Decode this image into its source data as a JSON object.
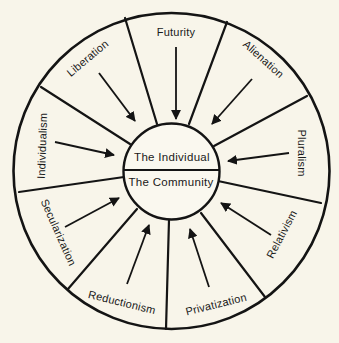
{
  "center": {
    "top_label": "The Individual",
    "bottom_label": "The Community"
  },
  "forces": [
    {
      "id": "futurity",
      "label": "Futurity"
    },
    {
      "id": "alienation",
      "label": "Alienation"
    },
    {
      "id": "pluralism",
      "label": "Pluralism"
    },
    {
      "id": "relativism",
      "label": "Relativism"
    },
    {
      "id": "privatization",
      "label": "Privatization"
    },
    {
      "id": "reductionism",
      "label": "Reductionism"
    },
    {
      "id": "secularization",
      "label": "Secularization"
    },
    {
      "id": "individualism",
      "label": "Individualism"
    },
    {
      "id": "liberation",
      "label": "Liberation"
    }
  ],
  "colors": {
    "background": "#f8f5ea",
    "line": "#141414"
  }
}
